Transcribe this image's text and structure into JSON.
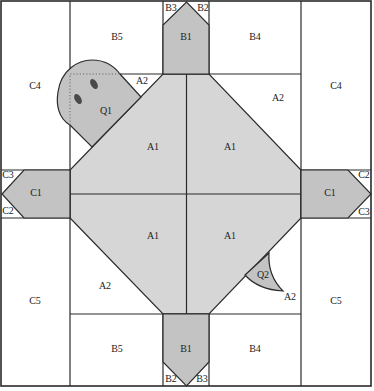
{
  "diagram": {
    "type": "quilt-block-pattern",
    "colors": {
      "background": "#ffffff",
      "light_gray_fill": "#d6d6d6",
      "speckled_fill": "#c3c3c3",
      "line": "#2a2a2a"
    },
    "labels": {
      "top_b3": "B3",
      "top_b2": "B2",
      "top_b1": "B1",
      "top_b5": "B5",
      "top_b4": "B4",
      "left_c4": "C4",
      "right_c4": "C4",
      "q1": "Q1",
      "a2_small": "A2",
      "a2_upper_right": "A2",
      "a1_upper_left": "A1",
      "a1_upper_right": "A1",
      "a1_lower_left": "A1",
      "a1_lower_right": "A1",
      "left_c3": "C3",
      "left_c1": "C1",
      "left_c2": "C2",
      "right_c2": "C2",
      "right_c1": "C1",
      "right_c3": "C3",
      "a2_lower_left": "A2",
      "q2": "Q2",
      "a2_tail": "A2",
      "left_c5": "C5",
      "right_c5": "C5",
      "bottom_b5": "B5",
      "bottom_b1": "B1",
      "bottom_b4": "B4",
      "bottom_b2": "B2",
      "bottom_b3": "B3"
    }
  }
}
